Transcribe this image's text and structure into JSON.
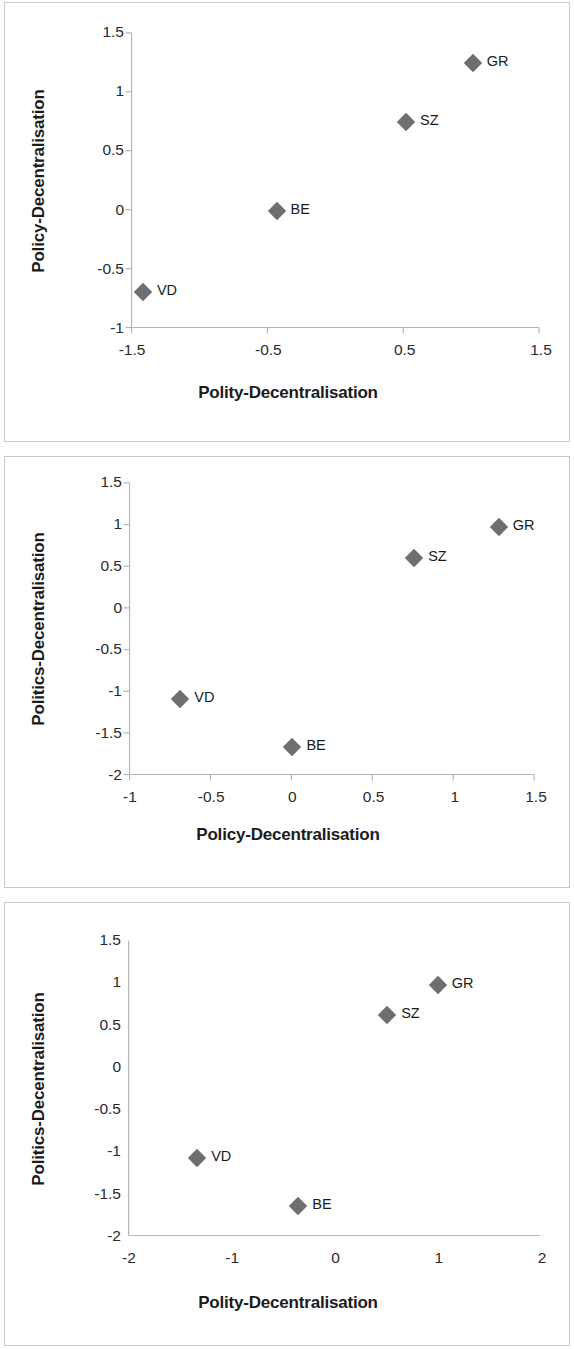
{
  "figure": {
    "panel_count": 3,
    "marker_color": "#6e6e6e",
    "axis_color": "#b5b5b5",
    "frame_color": "#c8c8c8",
    "text_color": "#1b1b1b"
  },
  "charts": [
    {
      "id": "chart-1",
      "type": "scatter",
      "title": "",
      "xlabel": "Polity-Decentralisation",
      "ylabel": "Policy-Decentralisation",
      "xlim": [
        -1.5,
        1.5
      ],
      "ylim": [
        -1,
        1.5
      ],
      "xticks": [
        -1.5,
        -0.5,
        0.5,
        1.5
      ],
      "xtick_labels": [
        "-1.5",
        "-0.5",
        "0.5",
        "1.5"
      ],
      "yticks": [
        -1,
        -0.5,
        0,
        0.5,
        1,
        1.5
      ],
      "ytick_labels": [
        "-1",
        "-0.5",
        "0",
        "0.5",
        "1",
        "1.5"
      ],
      "grid": false,
      "legend": "none",
      "tick_marks": true,
      "points": [
        {
          "label": "VD",
          "x": -1.42,
          "y": -0.69
        },
        {
          "label": "BE",
          "x": -0.44,
          "y": 0.0
        },
        {
          "label": "SZ",
          "x": 0.51,
          "y": 0.75
        },
        {
          "label": "GR",
          "x": 1.0,
          "y": 1.25
        }
      ]
    },
    {
      "id": "chart-2",
      "type": "scatter",
      "title": "",
      "xlabel": "Policy-Decentralisation",
      "ylabel": "Politics-Decentralisation",
      "xlim": [
        -1,
        1.5
      ],
      "ylim": [
        -2,
        1.5
      ],
      "xticks": [
        -1,
        -0.5,
        0,
        0.5,
        1,
        1.5
      ],
      "xtick_labels": [
        "-1",
        "-0.5",
        "0",
        "0.5",
        "1",
        "1.5"
      ],
      "yticks": [
        -2,
        -1.5,
        -1,
        -0.5,
        0,
        0.5,
        1,
        1.5
      ],
      "ytick_labels": [
        "-2",
        "-1.5",
        "-1",
        "-0.5",
        "0",
        "0.5",
        "1",
        "1.5"
      ],
      "grid": false,
      "legend": "none",
      "tick_marks": true,
      "points": [
        {
          "label": "BE",
          "x": 0.0,
          "y": -1.65
        },
        {
          "label": "VD",
          "x": -0.69,
          "y": -1.08
        },
        {
          "label": "SZ",
          "x": 0.75,
          "y": 0.61
        },
        {
          "label": "GR",
          "x": 1.27,
          "y": 0.97
        }
      ]
    },
    {
      "id": "chart-3",
      "type": "scatter",
      "title": "",
      "xlabel": "Polity-Decentralisation",
      "ylabel": "Politics-Decentralisation",
      "xlim": [
        -2,
        2
      ],
      "ylim": [
        -2,
        1.5
      ],
      "xticks": [
        -2,
        -1,
        0,
        1,
        2
      ],
      "xtick_labels": [
        "-2",
        "-1",
        "0",
        "1",
        "2"
      ],
      "yticks": [
        -2,
        -1.5,
        -1,
        -0.5,
        0,
        0.5,
        1,
        1.5
      ],
      "ytick_labels": [
        "-2",
        "-1.5",
        "-1",
        "-0.5",
        "0",
        "0.5",
        "1",
        "1.5"
      ],
      "grid": false,
      "legend": "none",
      "tick_marks": false,
      "points": [
        {
          "label": "BE",
          "x": -0.36,
          "y": -1.63
        },
        {
          "label": "VD",
          "x": -1.34,
          "y": -1.06
        },
        {
          "label": "SZ",
          "x": 0.5,
          "y": 0.62
        },
        {
          "label": "GR",
          "x": 0.99,
          "y": 0.98
        }
      ]
    }
  ],
  "chart_data": [
    {
      "type": "scatter",
      "title": "",
      "xlabel": "Polity-Decentralisation",
      "ylabel": "Policy-Decentralisation",
      "xlim": [
        -1.5,
        1.5
      ],
      "ylim": [
        -1,
        1.5
      ],
      "xticks": [
        -1.5,
        -0.5,
        0.5,
        1.5
      ],
      "yticks": [
        -1,
        -0.5,
        0,
        0.5,
        1,
        1.5
      ],
      "grid": false,
      "legend": "none",
      "series": [
        {
          "name": "Cantons",
          "labels": [
            "VD",
            "BE",
            "SZ",
            "GR"
          ],
          "x": [
            -1.42,
            -0.44,
            0.51,
            1.0
          ],
          "y": [
            -0.69,
            0.0,
            0.75,
            1.25
          ]
        }
      ]
    },
    {
      "type": "scatter",
      "title": "",
      "xlabel": "Policy-Decentralisation",
      "ylabel": "Politics-Decentralisation",
      "xlim": [
        -1,
        1.5
      ],
      "ylim": [
        -2,
        1.5
      ],
      "xticks": [
        -1,
        -0.5,
        0,
        0.5,
        1,
        1.5
      ],
      "yticks": [
        -2,
        -1.5,
        -1,
        -0.5,
        0,
        0.5,
        1,
        1.5
      ],
      "grid": false,
      "legend": "none",
      "series": [
        {
          "name": "Cantons",
          "labels": [
            "BE",
            "VD",
            "SZ",
            "GR"
          ],
          "x": [
            0.0,
            -0.69,
            0.75,
            1.27
          ],
          "y": [
            -1.65,
            -1.08,
            0.61,
            0.97
          ]
        }
      ]
    },
    {
      "type": "scatter",
      "title": "",
      "xlabel": "Polity-Decentralisation",
      "ylabel": "Politics-Decentralisation",
      "xlim": [
        -2,
        2
      ],
      "ylim": [
        -2,
        1.5
      ],
      "xticks": [
        -2,
        -1,
        0,
        1,
        2
      ],
      "yticks": [
        -2,
        -1.5,
        -1,
        -0.5,
        0,
        0.5,
        1,
        1.5
      ],
      "grid": false,
      "legend": "none",
      "series": [
        {
          "name": "Cantons",
          "labels": [
            "BE",
            "VD",
            "SZ",
            "GR"
          ],
          "x": [
            -0.36,
            -1.34,
            0.5,
            0.99
          ],
          "y": [
            -1.63,
            -1.06,
            0.62,
            0.98
          ]
        }
      ]
    }
  ]
}
